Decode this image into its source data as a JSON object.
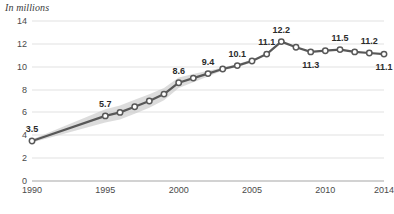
{
  "chart_data": {
    "type": "line",
    "title": "",
    "axis_note": "In millions",
    "xlabel": "",
    "ylabel": "",
    "grid": true,
    "legend": "none",
    "xlim": [
      1990,
      2014
    ],
    "ylim": [
      0,
      14
    ],
    "ytick_labels": [
      "0",
      "2",
      "4",
      "6",
      "8",
      "10",
      "12",
      "14"
    ],
    "ytick_values": [
      0,
      2,
      4,
      6,
      8,
      10,
      12,
      14
    ],
    "xtick_labels": [
      "1990",
      "1995",
      "2000",
      "2005",
      "2010",
      "2014"
    ],
    "xtick_values": [
      1990,
      1995,
      2000,
      2005,
      2010,
      2014
    ],
    "x": [
      1990,
      1995,
      1996,
      1997,
      1998,
      1999,
      2000,
      2001,
      2002,
      2003,
      2004,
      2005,
      2006,
      2007,
      2008,
      2009,
      2010,
      2011,
      2012,
      2013,
      2014
    ],
    "values": [
      3.5,
      5.7,
      6.0,
      6.5,
      7.0,
      7.6,
      8.6,
      9.0,
      9.4,
      9.8,
      10.1,
      10.5,
      11.1,
      12.2,
      11.7,
      11.3,
      11.4,
      11.5,
      11.3,
      11.2,
      11.1
    ],
    "point_labels": [
      {
        "x": 1990,
        "value": 3.5,
        "text": "3.5",
        "position": "above"
      },
      {
        "x": 1995,
        "value": 5.7,
        "text": "5.7",
        "position": "above"
      },
      {
        "x": 2000,
        "value": 8.6,
        "text": "8.6",
        "position": "above"
      },
      {
        "x": 2002,
        "value": 9.4,
        "text": "9.4",
        "position": "above"
      },
      {
        "x": 2004,
        "value": 10.1,
        "text": "10.1",
        "position": "above"
      },
      {
        "x": 2006,
        "value": 11.1,
        "text": "11.1",
        "position": "above"
      },
      {
        "x": 2007,
        "value": 12.2,
        "text": "12.2",
        "position": "above"
      },
      {
        "x": 2009,
        "value": 11.3,
        "text": "11.3",
        "position": "below"
      },
      {
        "x": 2011,
        "value": 11.5,
        "text": "11.5",
        "position": "above"
      },
      {
        "x": 2013,
        "value": 11.2,
        "text": "11.2",
        "position": "above"
      },
      {
        "x": 2014,
        "value": 11.1,
        "text": "11.1",
        "position": "below"
      }
    ],
    "uncertainty_band": {
      "present": true,
      "x_start": 1990,
      "x_end": 2005,
      "description": "shaded gray band around rising segment"
    },
    "colors": {
      "line": "#585858",
      "marker_fill": "#ffffff",
      "marker_stroke": "#585858",
      "band": "#c9c9c9",
      "grid": "#e2e2e2",
      "axis": "#a6a6a6",
      "text": "#3a3a3a"
    }
  }
}
